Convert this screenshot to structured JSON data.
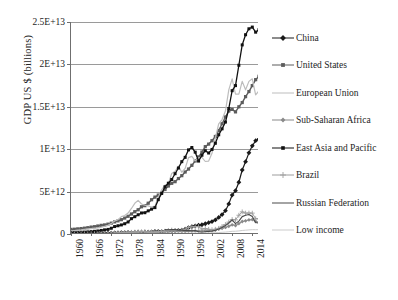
{
  "chart_data": {
    "type": "line",
    "title": "",
    "xlabel": "",
    "ylabel": "GDP US $ (billions)",
    "grid": true,
    "legend_position": "right",
    "xlim": [
      1960,
      2016
    ],
    "ylim": [
      0,
      25000000000000.0
    ],
    "yticks": [
      {
        "value": 0,
        "label": "0"
      },
      {
        "value": 5000000000000,
        "label": "5E+12"
      },
      {
        "value": 10000000000000,
        "label": "1E+13"
      },
      {
        "value": 15000000000000,
        "label": "1.5E+13"
      },
      {
        "value": 20000000000000,
        "label": "2E+13"
      },
      {
        "value": 25000000000000,
        "label": "2.5E+13"
      }
    ],
    "xticks": [
      "1960",
      "1966",
      "1972",
      "1978",
      "1984",
      "1990",
      "1996",
      "2002",
      "2008",
      "2014"
    ],
    "x": [
      1960,
      1961,
      1962,
      1963,
      1964,
      1965,
      1966,
      1967,
      1968,
      1969,
      1970,
      1971,
      1972,
      1973,
      1974,
      1975,
      1976,
      1977,
      1978,
      1979,
      1980,
      1981,
      1982,
      1983,
      1984,
      1985,
      1986,
      1987,
      1988,
      1989,
      1990,
      1991,
      1992,
      1993,
      1994,
      1995,
      1996,
      1997,
      1998,
      1999,
      2000,
      2001,
      2002,
      2003,
      2004,
      2005,
      2006,
      2007,
      2008,
      2009,
      2010,
      2011,
      2012,
      2013,
      2014,
      2015,
      2016
    ],
    "series": [
      {
        "name": "China",
        "color": "#1a1a1a",
        "marker": "diamond",
        "marker_size": 3,
        "line_width": 1.2,
        "values": [
          59700000000.0,
          50000000000.0,
          47100000000.0,
          50700000000.0,
          59700000000.0,
          70400000000.0,
          76000000000.0,
          72300000000.0,
          70100000000.0,
          78900000000.0,
          91500000000.0,
          98700000000.0,
          113000000000.0,
          138000000000.0,
          144000000000.0,
          163000000000.0,
          152000000000.0,
          174000000000.0,
          150000000000.0,
          178000000000.0,
          191000000000.0,
          196000000000.0,
          205000000000.0,
          230000000000.0,
          259000000000.0,
          309000000000.0,
          298000000000.0,
          271000000000.0,
          310000000000.0,
          344000000000.0,
          361000000000.0,
          383000000000.0,
          427000000000.0,
          444000000000.0,
          564000000000.0,
          735000000000.0,
          864000000000.0,
          962000000000.0,
          1030000000000.0,
          1090000000000.0,
          1210000000000.0,
          1340000000000.0,
          1470000000000.0,
          1660000000000.0,
          1960000000000.0,
          2290000000000.0,
          2750000000000.0,
          3550000000000.0,
          4590000000000.0,
          5110000000000.0,
          6100000000000.0,
          7550000000000.0,
          8530000000000.0,
          9570000000000.0,
          10400000000000.0,
          11000000000000.0,
          11200000000000.0
        ]
      },
      {
        "name": "United States",
        "color": "#5c5c5c",
        "marker": "square",
        "marker_size": 3.2,
        "line_width": 1.4,
        "values": [
          543000000000.0,
          563000000000.0,
          605000000000.0,
          639000000000.0,
          686000000000.0,
          744000000000.0,
          815000000000.0,
          862000000000.0,
          943000000000.0,
          1020000000000.0,
          1070000000000.0,
          1160000000000.0,
          1280000000000.0,
          1430000000000.0,
          1550000000000.0,
          1690000000000.0,
          1880000000000.0,
          2090000000000.0,
          2360000000000.0,
          2630000000000.0,
          2860000000000.0,
          3210000000000.0,
          3340000000000.0,
          3630000000000.0,
          4040000000000.0,
          4350000000000.0,
          4590000000000.0,
          4870000000000.0,
          5250000000000.0,
          5660000000000.0,
          5980000000000.0,
          6170000000000.0,
          6540000000000.0,
          6880000000000.0,
          7310000000000.0,
          7660000000000.0,
          8100000000000.0,
          8610000000000.0,
          9090000000000.0,
          9660000000000.0,
          10300000000000.0,
          10600000000000.0,
          11000000000000.0,
          11500000000000.0,
          12200000000000.0,
          13000000000000.0,
          13800000000000.0,
          14500000000000.0,
          14700000000000.0,
          14400000000000.0,
          15000000000000.0,
          15500000000000.0,
          16200000000000.0,
          16800000000000.0,
          17500000000000.0,
          18200000000000.0,
          18600000000000.0
        ]
      },
      {
        "name": "European Union",
        "color": "#bdbdbd",
        "marker": "none",
        "marker_size": 0,
        "line_width": 1.2,
        "values": [
          370000000000.0,
          405000000000.0,
          446000000000.0,
          492000000000.0,
          547000000000.0,
          594000000000.0,
          645000000000.0,
          689000000000.0,
          717000000000.0,
          803000000000.0,
          907000000000.0,
          1020000000000.0,
          1220000000000.0,
          1530000000000.0,
          1690000000000.0,
          2050000000000.0,
          2170000000000.0,
          2470000000000.0,
          3010000000000.0,
          3620000000000.0,
          3970000000000.0,
          3540000000000.0,
          3410000000000.0,
          3310000000000.0,
          3190000000000.0,
          3290000000000.0,
          4360000000000.0,
          5210000000000.0,
          5780000000000.0,
          5920000000000.0,
          7140000000000.0,
          7400000000000.0,
          8010000000000.0,
          7280000000000.0,
          7730000000000.0,
          9000000000000.0,
          9160000000000.0,
          8620000000000.0,
          8970000000000.0,
          9050000000000.0,
          8550000000000.0,
          8600000000000.0,
          9510000000000.0,
          11300000000000.0,
          13000000000000.0,
          13500000000000.0,
          14500000000000.0,
          17000000000000.0,
          18300000000000.0,
          16500000000000.0,
          16500000000000.0,
          18000000000000.0,
          17000000000000.0,
          18000000000000.0,
          18300000000000.0,
          16400000000000.0,
          16900000000000.0
        ]
      },
      {
        "name": "Sub-Saharan Africa",
        "color": "#8a8a8a",
        "marker": "diamond",
        "marker_size": 2.4,
        "line_width": 1.0,
        "values": [
          30000000000.0,
          31000000000.0,
          33000000000.0,
          36000000000.0,
          39000000000.0,
          42000000000.0,
          46000000000.0,
          47000000000.0,
          51000000000.0,
          59000000000.0,
          67000000000.0,
          71000000000.0,
          81000000000.0,
          105000000000.0,
          138000000000.0,
          148000000000.0,
          158000000000.0,
          179000000000.0,
          196000000000.0,
          234000000000.0,
          290000000000.0,
          282000000000.0,
          266000000000.0,
          252000000000.0,
          244000000000.0,
          229000000000.0,
          251000000000.0,
          286000000000.0,
          302000000000.0,
          315000000000.0,
          329000000000.0,
          330000000000.0,
          323000000000.0,
          305000000000.0,
          307000000000.0,
          342000000000.0,
          355000000000.0,
          366000000000.0,
          342000000000.0,
          345000000000.0,
          378000000000.0,
          364000000000.0,
          374000000000.0,
          470000000000.0,
          577000000000.0,
          676000000000.0,
          780000000000.0,
          914000000000.0,
          1080000000000.0,
          1000000000000.0,
          1230000000000.0,
          1470000000000.0,
          1550000000000.0,
          1660000000000.0,
          1700000000000.0,
          1470000000000.0,
          1400000000000.0
        ]
      },
      {
        "name": "East Asia and Pacific",
        "color": "#111111",
        "marker": "square",
        "marker_size": 3,
        "line_width": 1.3,
        "values": [
          163000000000.0,
          165000000000.0,
          176000000000.0,
          196000000000.0,
          223000000000.0,
          248000000000.0,
          278000000000.0,
          315000000000.0,
          357000000000.0,
          418000000000.0,
          488000000000.0,
          542000000000.0,
          678000000000.0,
          878000000000.0,
          971000000000.0,
          1070000000000.0,
          1210000000000.0,
          1420000000000.0,
          1810000000000.0,
          2040000000000.0,
          2270000000000.0,
          2480000000000.0,
          2510000000000.0,
          2730000000000.0,
          2930000000000.0,
          3110000000000.0,
          4050000000000.0,
          4780000000000.0,
          5570000000000.0,
          5990000000000.0,
          6430000000000.0,
          7110000000000.0,
          7780000000000.0,
          8530000000000.0,
          9040000000000.0,
          9920000000000.0,
          10200000000000.0,
          9650000000000.0,
          8600000000000.0,
          9290000000000.0,
          9820000000000.0,
          9550000000000.0,
          9970000000000.0,
          10700000000000.0,
          11700000000000.0,
          12400000000000.0,
          13200000000000.0,
          14800000000000.0,
          16900000000000.0,
          17500000000000.0,
          19900000000000.0,
          22300000000000.0,
          23500000000000.0,
          24200000000000.0,
          24400000000000.0,
          23800000000000.0,
          24100000000000.0
        ]
      },
      {
        "name": "Brazil",
        "color": "#9e9e9e",
        "marker": "cross",
        "marker_size": 2.4,
        "line_width": 1.0,
        "values": [
          15000000000.0,
          15300000000.0,
          19900000000.0,
          23000000000.0,
          21100000000.0,
          21900000000.0,
          27000000000.0,
          30400000000.0,
          33900000000.0,
          37400000000.0,
          42500000000.0,
          49500000000.0,
          58900000000.0,
          79400000000.0,
          106000000000.0,
          124000000000.0,
          152000000000.0,
          177000000000.0,
          201000000000.0,
          224000000000.0,
          235000000000.0,
          263000000000.0,
          282000000000.0,
          203000000000.0,
          205000000000.0,
          222000000000.0,
          268000000000.0,
          294000000000.0,
          331000000000.0,
          425000000000.0,
          462000000000.0,
          406000000000.0,
          390000000000.0,
          438000000000.0,
          559000000000.0,
          770000000000.0,
          851000000000.0,
          883000000000.0,
          864000000000.0,
          586000000000.0,
          644000000000.0,
          554000000000.0,
          504000000000.0,
          558000000000.0,
          669000000000.0,
          892000000000.0,
          1110000000000.0,
          1400000000000.0,
          1700000000000.0,
          1670000000000.0,
          2210000000000.0,
          2610000000000.0,
          2460000000000.0,
          2470000000000.0,
          2460000000000.0,
          1800000000000.0,
          1800000000000.0
        ]
      },
      {
        "name": "Russian Federation",
        "color": "#4a4a4a",
        "marker": "none",
        "marker_size": 0,
        "line_width": 1.1,
        "values": [
          0,
          0,
          0,
          0,
          0,
          0,
          0,
          0,
          0,
          0,
          0,
          0,
          0,
          0,
          0,
          0,
          0,
          0,
          0,
          0,
          0,
          0,
          0,
          0,
          0,
          0,
          0,
          0,
          516000000000.0,
          507000000000.0,
          517000000000.0,
          518000000000.0,
          460000000000.0,
          435000000000.0,
          396000000000.0,
          396000000000.0,
          392000000000.0,
          405000000000.0,
          271000000000.0,
          196000000000.0,
          260000000000.0,
          307000000000.0,
          345000000000.0,
          431000000000.0,
          591000000000.0,
          764000000000.0,
          990000000000.0,
          1300000000000.0,
          1660000000000.0,
          1220000000000.0,
          1520000000000.0,
          2050000000000.0,
          2210000000000.0,
          2290000000000.0,
          2060000000000.0,
          1360000000000.0,
          1280000000000.0
        ]
      },
      {
        "name": "Low income",
        "color": "#cccccc",
        "marker": "none",
        "marker_size": 0,
        "line_width": 1.0,
        "values": [
          12000000000.0,
          12200000000.0,
          12800000000.0,
          13400000000.0,
          14500000000.0,
          15500000000.0,
          16500000000.0,
          17000000000.0,
          17800000000.0,
          19200000000.0,
          21000000000.0,
          22200000000.0,
          25000000000.0,
          30000000000.0,
          36000000000.0,
          40000000000.0,
          42000000000.0,
          46000000000.0,
          53000000000.0,
          60000000000.0,
          68000000000.0,
          70000000000.0,
          70000000000.0,
          70000000000.0,
          68000000000.0,
          69000000000.0,
          76000000000.0,
          82000000000.0,
          88000000000.0,
          92000000000.0,
          96000000000.0,
          98000000000.0,
          99000000000.0,
          96000000000.0,
          94000000000.0,
          103000000000.0,
          108000000000.0,
          112000000000.0,
          113000000000.0,
          117000000000.0,
          122000000000.0,
          124000000000.0,
          131000000000.0,
          150000000000.0,
          174000000000.0,
          200000000000.0,
          226000000000.0,
          265000000000.0,
          314000000000.0,
          325000000000.0,
          364000000000.0,
          418000000000.0,
          449000000000.0,
          484000000000.0,
          512000000000.0,
          505000000000.0,
          508000000000.0
        ]
      }
    ]
  },
  "legend": {
    "items": [
      {
        "label": "China"
      },
      {
        "label": "United States"
      },
      {
        "label": "European Union"
      },
      {
        "label": "Sub-Saharan Africa"
      },
      {
        "label": "East Asia and Pacific"
      },
      {
        "label": "Brazil"
      },
      {
        "label": "Russian Federation"
      },
      {
        "label": "Low income"
      }
    ]
  }
}
